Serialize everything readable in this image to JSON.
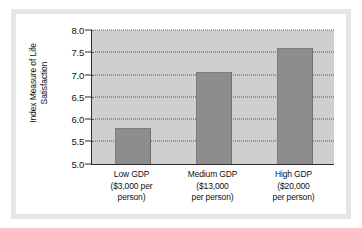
{
  "figure": {
    "y_axis_title_lines": [
      "Index Measure of Life",
      "Satisfaction"
    ],
    "frame_color": "#e6e6e6",
    "plot_background": "#cfcfcf",
    "bar_color": "#8d8d8d",
    "axis_color": "#2b2b2b",
    "gridline_color": "#545454"
  },
  "chart_data": {
    "type": "bar",
    "title": "",
    "xlabel": "",
    "ylabel": "Index Measure of Life Satisfaction",
    "categories": [
      "Low GDP ($3,000 per person)",
      "Medium GDP ($13,000 per person)",
      "High GDP ($20,000 per person)"
    ],
    "category_label_lines": [
      [
        "Low GDP",
        "($3,000 per",
        "person)"
      ],
      [
        "Medium GDP",
        "($13,000",
        "per person)"
      ],
      [
        "High GDP",
        "($20,000",
        "per person)"
      ]
    ],
    "values": [
      5.8,
      7.05,
      7.6
    ],
    "ylim": [
      5.0,
      8.0
    ],
    "ytick_values": [
      5.0,
      5.5,
      6.0,
      6.5,
      7.0,
      7.5,
      8.0
    ],
    "ytick_labels": [
      "5.0",
      "5.5",
      "6.0",
      "6.5",
      "7.0",
      "7.5",
      "8.0"
    ],
    "grid": true,
    "grid_style": "dotted",
    "grid_axis": "y",
    "legend": null,
    "legend_position": "none"
  }
}
